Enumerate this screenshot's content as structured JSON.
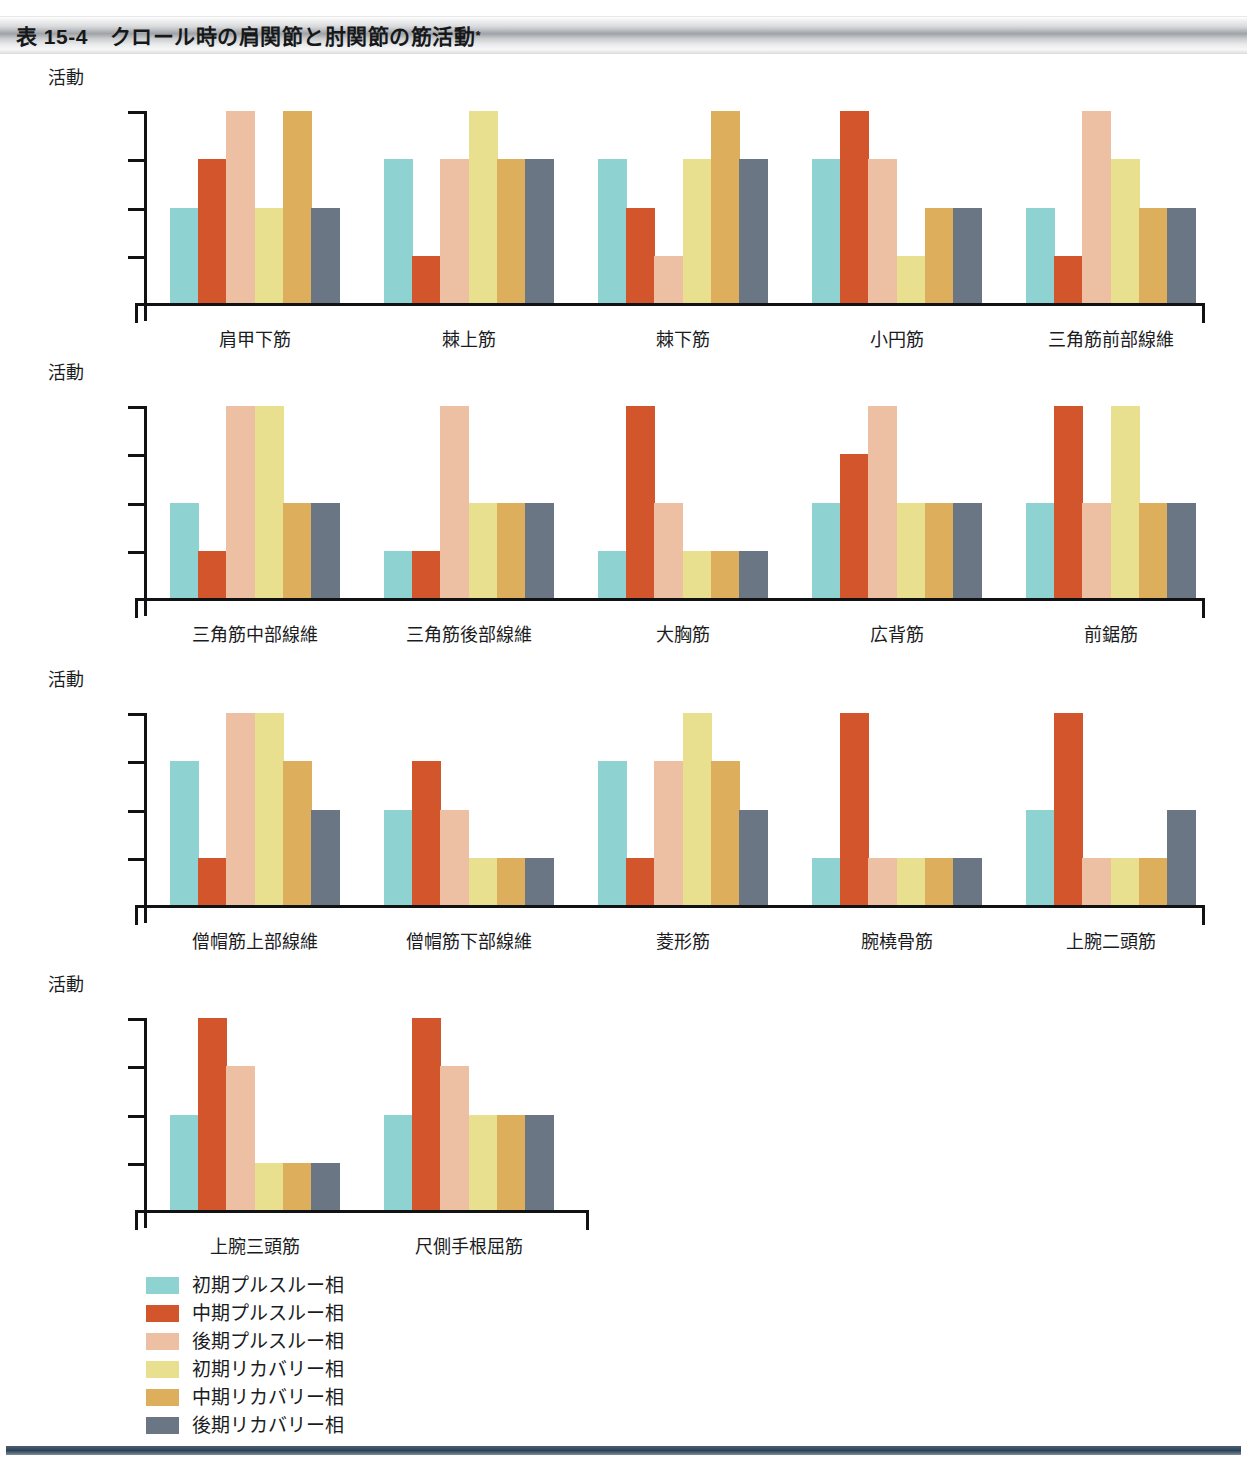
{
  "header": {
    "table_number": "表 15-4",
    "title": "クロール時の肩関節と肘関節の筋活動",
    "footnote_marker": "*"
  },
  "axis": {
    "caption": "活動",
    "levels": [
      "ピーク",
      "高度",
      "中等度",
      "最小〜無"
    ]
  },
  "legend": {
    "items": [
      {
        "label": "初期プルスルー相",
        "color": "#8fd2d2"
      },
      {
        "label": "中期プルスルー相",
        "color": "#d2552c"
      },
      {
        "label": "後期プルスルー相",
        "color": "#edbfa3"
      },
      {
        "label": "初期リカバリー相",
        "color": "#e8e08e"
      },
      {
        "label": "中期リカバリー相",
        "color": "#ddae5b"
      },
      {
        "label": "後期リカバリー相",
        "color": "#6b7684"
      }
    ]
  },
  "chart_data": {
    "type": "bar",
    "title": "クロール時の肩関節と肘関節の筋活動",
    "xlabel": "",
    "ylabel": "活動",
    "grid": false,
    "legend_position": "bottom-left",
    "y_levels": [
      "最小〜無",
      "中等度",
      "高度",
      "ピーク"
    ],
    "y_level_values": {
      "最小〜無": 1,
      "中等度": 2,
      "高度": 3,
      "ピーク": 4
    },
    "ylim": [
      0,
      4.4
    ],
    "series": [
      {
        "name": "初期プルスルー相",
        "color": "#8fd2d2"
      },
      {
        "name": "中期プルスルー相",
        "color": "#d2552c"
      },
      {
        "name": "後期プルスルー相",
        "color": "#edbfa3"
      },
      {
        "name": "初期リカバリー相",
        "color": "#e8e08e"
      },
      {
        "name": "中期リカバリー相",
        "color": "#ddae5b"
      },
      {
        "name": "後期リカバリー相",
        "color": "#6b7684"
      }
    ],
    "rows": [
      {
        "row": 1,
        "groups": [
          {
            "category": "肩甲下筋",
            "values": [
              2,
              3,
              4,
              2,
              4,
              2
            ]
          },
          {
            "category": "棘上筋",
            "values": [
              3,
              1,
              3,
              4,
              3,
              3
            ]
          },
          {
            "category": "棘下筋",
            "values": [
              3,
              2,
              1,
              3,
              4,
              3
            ]
          },
          {
            "category": "小円筋",
            "values": [
              3,
              4,
              3,
              1,
              2,
              2
            ]
          },
          {
            "category": "三角筋前部線維",
            "values": [
              2,
              1,
              4,
              3,
              2,
              2
            ]
          }
        ]
      },
      {
        "row": 2,
        "groups": [
          {
            "category": "三角筋中部線維",
            "values": [
              2,
              1,
              4,
              4,
              2,
              2
            ]
          },
          {
            "category": "三角筋後部線維",
            "values": [
              1,
              1,
              4,
              2,
              2,
              2
            ]
          },
          {
            "category": "大胸筋",
            "values": [
              1,
              4,
              2,
              1,
              1,
              1
            ]
          },
          {
            "category": "広背筋",
            "values": [
              2,
              3,
              4,
              2,
              2,
              2
            ]
          },
          {
            "category": "前鋸筋",
            "values": [
              2,
              4,
              2,
              4,
              2,
              2
            ]
          }
        ]
      },
      {
        "row": 3,
        "groups": [
          {
            "category": "僧帽筋上部線維",
            "values": [
              3,
              1,
              4,
              4,
              3,
              2
            ]
          },
          {
            "category": "僧帽筋下部線維",
            "values": [
              2,
              3,
              2,
              1,
              1,
              1
            ]
          },
          {
            "category": "菱形筋",
            "values": [
              3,
              1,
              3,
              4,
              3,
              2
            ]
          },
          {
            "category": "腕橈骨筋",
            "values": [
              1,
              4,
              1,
              1,
              1,
              1
            ]
          },
          {
            "category": "上腕二頭筋",
            "values": [
              2,
              4,
              1,
              1,
              1,
              2
            ]
          }
        ]
      },
      {
        "row": 4,
        "groups": [
          {
            "category": "上腕三頭筋",
            "values": [
              2,
              4,
              3,
              1,
              1,
              1
            ]
          },
          {
            "category": "尺側手根屈筋",
            "values": [
              2,
              4,
              3,
              2,
              2,
              2
            ]
          }
        ]
      }
    ]
  }
}
